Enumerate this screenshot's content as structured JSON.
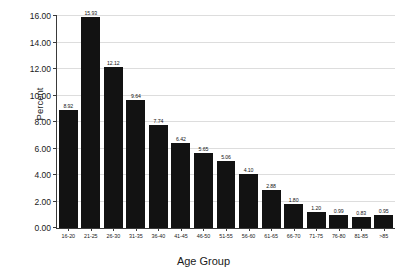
{
  "chart_data": {
    "type": "bar",
    "title": "",
    "xlabel": "Age Group",
    "ylabel": "Percent",
    "categories": [
      "16-20",
      "21-25",
      "26-30",
      "31-35",
      "36-40",
      "41-45",
      "46-50",
      "51-55",
      "56-60",
      "61-65",
      "66-70",
      "71-75",
      "76-80",
      "81-85",
      ">85"
    ],
    "values": [
      8.92,
      15.93,
      12.12,
      9.64,
      7.74,
      6.42,
      5.65,
      5.06,
      4.1,
      2.88,
      1.8,
      1.2,
      0.99,
      0.83,
      0.95
    ],
    "data_labels": [
      "8.92",
      "15.93",
      "12.12",
      "9.64",
      "7.74",
      "6.42",
      "5.65",
      "5.06",
      "4.10",
      "2.88",
      "1.80",
      "1.20",
      "0.99",
      "0.83",
      "0.95"
    ],
    "ylim": [
      0,
      16
    ],
    "ytick_labels": [
      "0.00",
      "2.00",
      "4.00",
      "6.00",
      "8.00",
      "10.00",
      "12.00",
      "14.00",
      "16.00"
    ],
    "ytick_values": [
      0,
      2,
      4,
      6,
      8,
      10,
      12,
      14,
      16
    ],
    "grid": true,
    "legend": false,
    "bar_color": "#121212",
    "grid_color": "#dddddd",
    "axis_color": "#3a3a3a",
    "text_color": "#1a1a1a",
    "background": "#ffffff"
  }
}
